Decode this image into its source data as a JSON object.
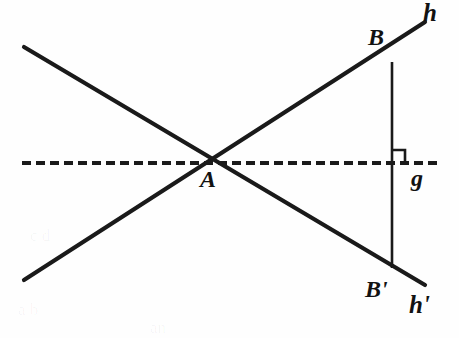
{
  "figure": {
    "background_color": "#fefefe",
    "stroke_color": "#1a1a1a",
    "width": 459,
    "height": 338,
    "labels": {
      "point_a": "A",
      "point_b": "B",
      "point_b_prime": "B'",
      "line_h": "h",
      "line_h_prime": "h'",
      "line_g": "g"
    },
    "scan_bleed": {
      "line_1": "a b",
      "line_2": "c d",
      "line_3": "an"
    }
  },
  "chart_data": {
    "type": "diagram",
    "subtype": "plane-geometry-reflection",
    "coordinate_system": "image pixels, origin top-left",
    "points": [
      {
        "name": "A",
        "label": "A",
        "x": 213,
        "y": 163,
        "label_x": 212,
        "label_y": 186,
        "description": "intersection of lines h, h' and axis g"
      },
      {
        "name": "B",
        "label": "B",
        "x": 392,
        "y": 62,
        "label_x": 380,
        "label_y": 44,
        "description": "point on line h"
      },
      {
        "name": "B'",
        "label": "B'",
        "x": 392,
        "y": 268,
        "label_x": 377,
        "label_y": 296,
        "description": "mirror image of B on line h'"
      },
      {
        "name": "F",
        "label": "",
        "x": 392,
        "y": 163,
        "description": "foot of perpendicular from B to axis g"
      }
    ],
    "lines": [
      {
        "name": "h",
        "label": "h",
        "style": "solid",
        "x1": 24,
        "y1": 280,
        "x2": 425,
        "y2": 22,
        "label_x": 432,
        "label_y": 20,
        "description": "line through A and B, rising to the right"
      },
      {
        "name": "h'",
        "label": "h'",
        "style": "solid",
        "x1": 24,
        "y1": 47,
        "x2": 425,
        "y2": 285,
        "label_x": 418,
        "label_y": 312,
        "description": "reflected line through A and B', falling to the right"
      },
      {
        "name": "g",
        "label": "g",
        "style": "dashed",
        "x1": 22,
        "y1": 163,
        "x2": 440,
        "y2": 163,
        "label_x": 420,
        "label_y": 186,
        "description": "horizontal dashed mirror axis",
        "dash_length": 9,
        "gap_length": 5
      }
    ],
    "segments": [
      {
        "name": "BB'",
        "style": "solid",
        "x1": 392,
        "y1": 62,
        "x2": 392,
        "y2": 268,
        "description": "vertical segment joining B and B', perpendicular to g"
      }
    ],
    "angle_markers": [
      {
        "name": "right-angle-at-foot",
        "type": "right-angle",
        "vertex_x": 392,
        "vertex_y": 163,
        "size": 13,
        "opens": "up-right",
        "description": "square marker showing BB' is perpendicular to g"
      }
    ]
  }
}
